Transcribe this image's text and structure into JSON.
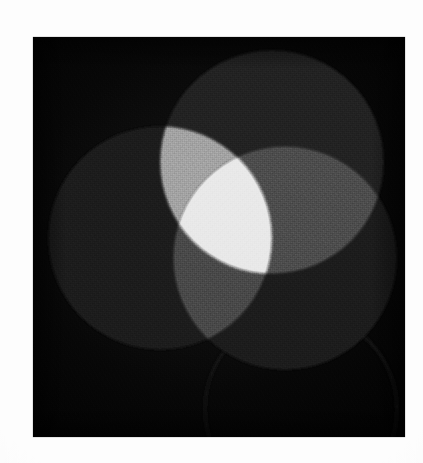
{
  "page": {
    "background_color": "#fdfdfd",
    "width": 423,
    "height": 463,
    "caption": ""
  },
  "plate": {
    "background_color": "#060606",
    "left": 33,
    "top": 37,
    "width": 372,
    "height": 400
  },
  "figure": {
    "kind": "additive-mixing-venn",
    "description": "Three overlapping circles of light photographed in black and white, forming a three-way Venn arrangement whose pairwise and triple overlaps are progressively brighter.",
    "circle_radius": 112,
    "circles": [
      {
        "id": "top",
        "label": "",
        "cx": 239,
        "cy": 125,
        "r": 112,
        "fill": "#232323"
      },
      {
        "id": "left",
        "label": "",
        "cx": 127,
        "cy": 201,
        "r": 112,
        "fill": "#1a1a1a"
      },
      {
        "id": "right",
        "label": "",
        "cx": 252,
        "cy": 221,
        "r": 112,
        "fill": "#1e1e1e"
      }
    ],
    "overlaps": [
      {
        "id": "top-left",
        "members": [
          "top",
          "left"
        ],
        "fill": "#a3a3a3"
      },
      {
        "id": "top-right",
        "members": [
          "top",
          "right"
        ],
        "fill": "#4e4e4e"
      },
      {
        "id": "left-right",
        "members": [
          "left",
          "right"
        ],
        "fill": "#4a4a4a"
      },
      {
        "id": "triple-center",
        "members": [
          "top",
          "left",
          "right"
        ],
        "fill": "#e9e9e9"
      }
    ],
    "ghost_arc": {
      "id": "ghost-circle",
      "cx": 268,
      "cy": 372,
      "r": 96,
      "stroke": "#1b1b1b",
      "note": "faint residual circle outline in the lower right of the plate"
    }
  },
  "colors": {
    "paper": "#fdfdfd",
    "plate": "#060606",
    "single_darkest": "#1a1a1a",
    "single_mid": "#1e1e1e",
    "single_lightest": "#232323",
    "pair_dim_a": "#4a4a4a",
    "pair_dim_b": "#4e4e4e",
    "pair_bright": "#a3a3a3",
    "triple": "#e9e9e9"
  }
}
